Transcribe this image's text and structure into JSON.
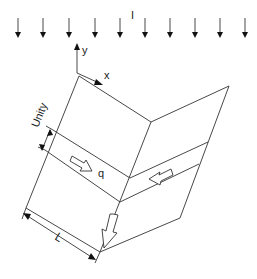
{
  "diagram": {
    "type": "folded-plate-solar-collector-schematic",
    "labels": {
      "irradiance": "I",
      "axis_x": "x",
      "axis_y": "y",
      "unity": "Unity",
      "flow": "q",
      "length": "L"
    },
    "irradiance_arrows": {
      "count": 10,
      "x_positions": [
        18,
        43,
        69,
        95,
        120,
        145,
        170,
        195,
        220,
        245
      ],
      "y_top": 18,
      "y_tip": 38
    },
    "colors": {
      "line": "#333333",
      "background": "#ffffff",
      "text": "#1a1a1a"
    }
  }
}
